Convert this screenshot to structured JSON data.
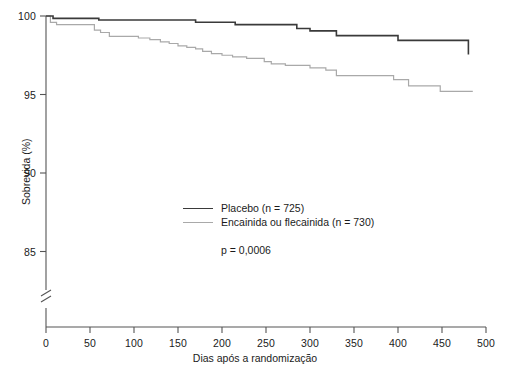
{
  "chart_data": {
    "type": "line",
    "subtype": "kaplan-meier-step",
    "title": "",
    "xlabel": "Dias após a randomização",
    "ylabel": "Sobrevida (%)",
    "xlim": [
      0,
      500
    ],
    "ylim": [
      82.5,
      100
    ],
    "y_axis_break": true,
    "y_axis_break_below": 85,
    "grid": false,
    "xticks": [
      0,
      50,
      100,
      150,
      200,
      250,
      300,
      350,
      400,
      450,
      500
    ],
    "yticks": [
      85,
      90,
      95,
      100
    ],
    "legend_position": "center",
    "annotations": [
      {
        "text": "p = 0,0006",
        "x": 205,
        "y": 87.2
      }
    ],
    "series": [
      {
        "name": "Placebo (n = 725)",
        "label": "Placebo",
        "n": 725,
        "color": "#3a3a3a",
        "linewidth": 1.6,
        "points": [
          [
            0,
            100.0
          ],
          [
            8,
            100.0
          ],
          [
            8,
            99.85
          ],
          [
            60,
            99.85
          ],
          [
            60,
            99.75
          ],
          [
            170,
            99.75
          ],
          [
            170,
            99.6
          ],
          [
            215,
            99.6
          ],
          [
            215,
            99.45
          ],
          [
            285,
            99.45
          ],
          [
            285,
            99.2
          ],
          [
            300,
            99.2
          ],
          [
            300,
            99.05
          ],
          [
            330,
            99.05
          ],
          [
            330,
            98.75
          ],
          [
            400,
            98.75
          ],
          [
            400,
            98.45
          ],
          [
            480,
            98.45
          ],
          [
            480,
            97.55
          ]
        ]
      },
      {
        "name": "Encainida ou flecainida (n = 730)",
        "label": "Encainida ou flecainida",
        "n": 730,
        "color": "#a9a9a9",
        "linewidth": 1.2,
        "points": [
          [
            0,
            100.0
          ],
          [
            5,
            100.0
          ],
          [
            5,
            99.6
          ],
          [
            12,
            99.6
          ],
          [
            12,
            99.45
          ],
          [
            55,
            99.45
          ],
          [
            55,
            99.1
          ],
          [
            62,
            99.1
          ],
          [
            62,
            98.95
          ],
          [
            72,
            98.95
          ],
          [
            72,
            98.7
          ],
          [
            105,
            98.7
          ],
          [
            105,
            98.6
          ],
          [
            118,
            98.6
          ],
          [
            118,
            98.5
          ],
          [
            130,
            98.5
          ],
          [
            130,
            98.35
          ],
          [
            140,
            98.35
          ],
          [
            140,
            98.25
          ],
          [
            150,
            98.25
          ],
          [
            150,
            98.1
          ],
          [
            160,
            98.1
          ],
          [
            160,
            98.0
          ],
          [
            170,
            98.0
          ],
          [
            170,
            97.9
          ],
          [
            178,
            97.9
          ],
          [
            178,
            97.75
          ],
          [
            188,
            97.75
          ],
          [
            188,
            97.6
          ],
          [
            200,
            97.6
          ],
          [
            200,
            97.5
          ],
          [
            212,
            97.5
          ],
          [
            212,
            97.4
          ],
          [
            228,
            97.4
          ],
          [
            228,
            97.3
          ],
          [
            248,
            97.3
          ],
          [
            248,
            97.1
          ],
          [
            256,
            97.1
          ],
          [
            256,
            96.95
          ],
          [
            272,
            96.95
          ],
          [
            272,
            96.85
          ],
          [
            300,
            96.85
          ],
          [
            300,
            96.7
          ],
          [
            318,
            96.7
          ],
          [
            318,
            96.55
          ],
          [
            330,
            96.55
          ],
          [
            330,
            96.2
          ],
          [
            395,
            96.2
          ],
          [
            395,
            95.95
          ],
          [
            412,
            95.95
          ],
          [
            412,
            95.55
          ],
          [
            448,
            95.55
          ],
          [
            448,
            95.2
          ],
          [
            485,
            95.2
          ]
        ]
      }
    ]
  },
  "axes": {
    "y_label": "Sobrevida (%)",
    "x_label": "Dias após a randomização",
    "y_tick_labels": [
      "100",
      "95",
      "90",
      "85"
    ],
    "x_tick_labels": [
      "0",
      "50",
      "100",
      "150",
      "200",
      "250",
      "300",
      "350",
      "400",
      "450",
      "500"
    ]
  },
  "legend": {
    "items": [
      {
        "label": "Placebo (n = 725)",
        "color": "#3a3a3a"
      },
      {
        "label": "Encainida ou flecainida (n = 730)",
        "color": "#a9a9a9"
      }
    ]
  },
  "pvalue": {
    "text": "p = 0,0006"
  },
  "colors": {
    "axis": "#555555",
    "placebo": "#3a3a3a",
    "treatment": "#a9a9a9",
    "text": "#1b1b1b",
    "background": "#ffffff"
  }
}
